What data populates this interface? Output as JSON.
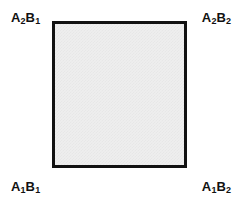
{
  "figure": {
    "name": "two-factor-two-level-design-square",
    "background_color": "#ffffff"
  },
  "square": {
    "fill_color": "#eeeeee",
    "border_color": "#111111",
    "border_width_px": 3
  },
  "corners": {
    "top_left": {
      "factor_a": "A",
      "a_level": "2",
      "factor_b": "B",
      "b_level": "1"
    },
    "top_right": {
      "factor_a": "A",
      "a_level": "2",
      "factor_b": "B",
      "b_level": "2"
    },
    "bottom_left": {
      "factor_a": "A",
      "a_level": "1",
      "factor_b": "B",
      "b_level": "1"
    },
    "bottom_right": {
      "factor_a": "A",
      "a_level": "1",
      "factor_b": "B",
      "b_level": "2"
    }
  }
}
